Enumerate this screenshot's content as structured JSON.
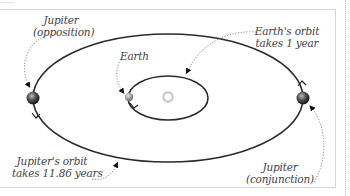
{
  "diagram": {
    "bodies": {
      "sun": {
        "name": "Sun",
        "icon": "sun-glow",
        "color": "#c8c8c8"
      },
      "earth": {
        "name": "Earth",
        "icon": "planet-sphere",
        "color": "#9a9a9a"
      },
      "jupiter_opposition": {
        "name": "Jupiter",
        "icon": "planet-sphere",
        "color": "#4a4a4a"
      },
      "jupiter_conjunction": {
        "name": "Jupiter",
        "icon": "planet-sphere",
        "color": "#4a4a4a"
      }
    },
    "labels": {
      "jupiter_opposition": {
        "line1": "Jupiter",
        "line2": "(opposition)"
      },
      "earth": {
        "line1": "Earth"
      },
      "earth_orbit": {
        "line1": "Earth's orbit",
        "line2": "takes 1 year"
      },
      "jupiter_orbit": {
        "line1": "Jupiter's orbit",
        "line2": "takes 11.86 years"
      },
      "jupiter_conjunction": {
        "line1": "Jupiter",
        "line2": "(conjunction)"
      }
    },
    "orbits": {
      "earth_period": "1 year",
      "jupiter_period": "11.86 years"
    },
    "colors": {
      "orbit_line": "#2b2b2b",
      "leader_line": "#8a8a8a",
      "frame": "#d6d6d6",
      "text": "#444444"
    }
  }
}
